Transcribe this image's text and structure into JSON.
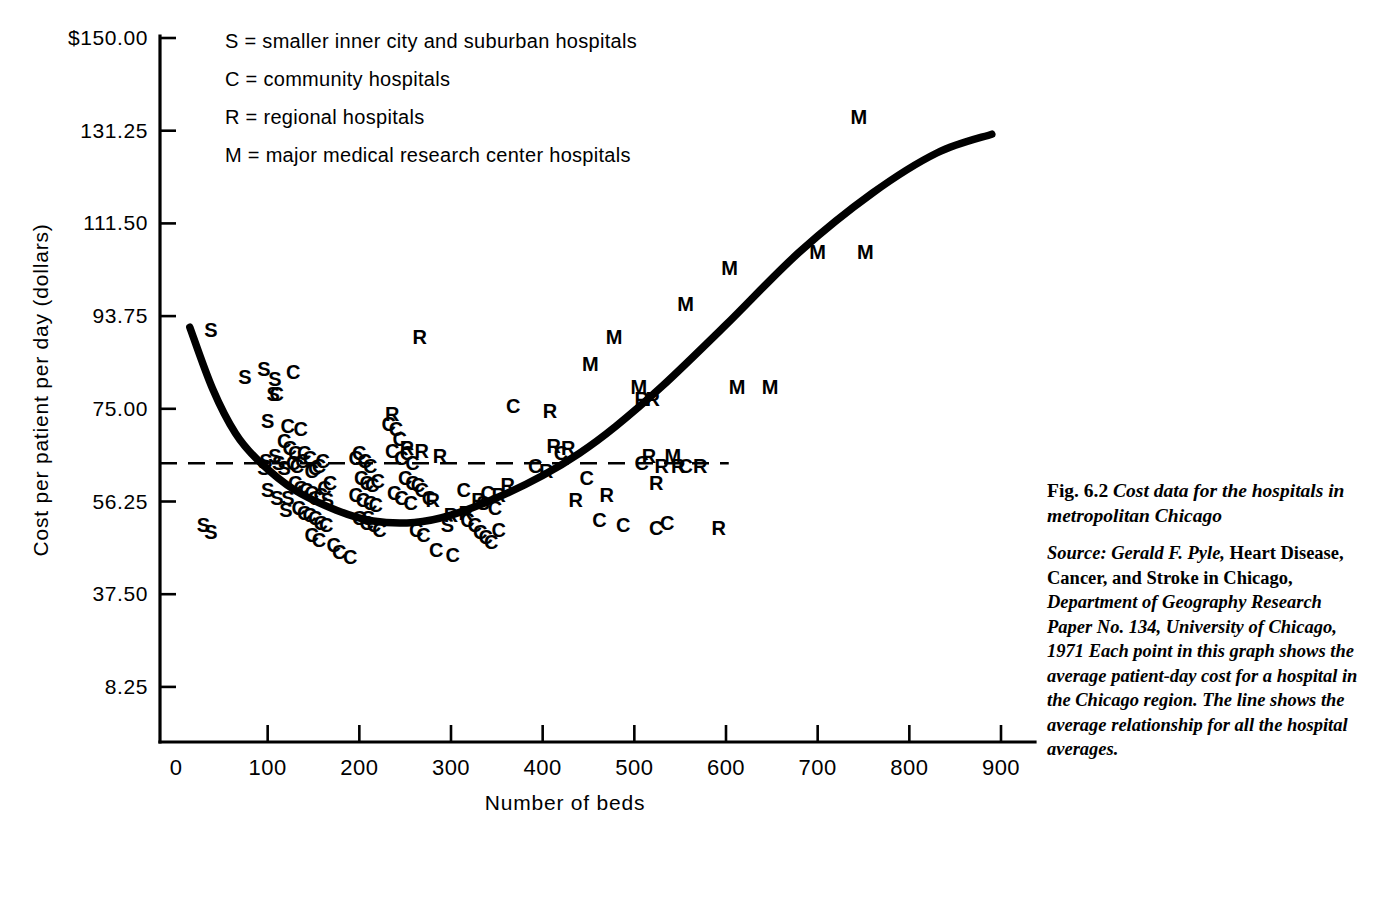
{
  "figure": {
    "caption_number": "Fig. 6.2",
    "caption_title": "Cost data for the hospitals in metropolitan Chicago",
    "source_line1_italic": "Source: Gerald F. Pyle,",
    "source_line1_roman": "Heart Disease, Cancer, and Stroke in Chicago,",
    "source_line2_italic": "Department of Geography Research Paper No. 134, University of Chicago, 1971 Each point in this graph shows the average patient-day cost for a hospital in the Chicago region. The line shows the average relationship for all the hospital averages."
  },
  "legend": {
    "items": [
      {
        "key": "S",
        "text": "S = smaller inner city and suburban hospitals"
      },
      {
        "key": "C",
        "text": "C = community hospitals"
      },
      {
        "key": "R",
        "text": "R = regional hospitals"
      },
      {
        "key": "M",
        "text": "M = major medical research center hospitals"
      }
    ]
  },
  "chart_data": {
    "type": "scatter",
    "title": "Cost data for the hospitals in metropolitan Chicago",
    "xlabel": "Number of beds",
    "ylabel": "Cost per patient per day (dollars)",
    "xlim": [
      0,
      950
    ],
    "ylim": [
      8.25,
      150.0
    ],
    "grid": false,
    "legend_position": "top-left-inside",
    "xticks": [
      0,
      100,
      200,
      300,
      400,
      500,
      600,
      700,
      800,
      900
    ],
    "xtick_labels": [
      "0",
      "100",
      "200",
      "300",
      "400",
      "500",
      "600",
      "700",
      "800",
      "900"
    ],
    "yticks": [
      8.25,
      37.5,
      56.25,
      75.0,
      93.75,
      111.5,
      131.25,
      150.0
    ],
    "ytick_labels": [
      "8.25",
      "37.50",
      "56.25",
      "75.00",
      "93.75",
      "111.50",
      "131.25",
      "$150.00"
    ],
    "series": [
      {
        "name": "S = smaller inner city and suburban hospitals",
        "marker": "S",
        "points": [
          [
            38,
            91.0
          ],
          [
            75,
            81.5
          ],
          [
            96,
            83.0
          ],
          [
            108,
            81.0
          ],
          [
            106,
            78.0
          ],
          [
            100,
            72.5
          ],
          [
            98,
            64.5
          ],
          [
            96,
            63.0
          ],
          [
            108,
            65.5
          ],
          [
            112,
            64.0
          ],
          [
            100,
            58.5
          ],
          [
            118,
            63.0
          ],
          [
            30,
            51.5
          ],
          [
            38,
            50.0
          ],
          [
            120,
            54.5
          ],
          [
            110,
            57.0
          ],
          [
            122,
            57.0
          ],
          [
            165,
            56.5
          ],
          [
            210,
            53.0
          ],
          [
            296,
            51.5
          ],
          [
            335,
            56.0
          ]
        ]
      },
      {
        "name": "C = community hospitals",
        "marker": "C",
        "points": [
          [
            128,
            82.5
          ],
          [
            110,
            78.0
          ],
          [
            122,
            71.5
          ],
          [
            136,
            71.0
          ],
          [
            118,
            68.5
          ],
          [
            124,
            67.0
          ],
          [
            130,
            66.0
          ],
          [
            128,
            64.0
          ],
          [
            132,
            63.5
          ],
          [
            138,
            64.5
          ],
          [
            140,
            66.0
          ],
          [
            146,
            65.0
          ],
          [
            148,
            62.5
          ],
          [
            152,
            63.0
          ],
          [
            156,
            63.5
          ],
          [
            160,
            64.5
          ],
          [
            130,
            60.0
          ],
          [
            136,
            59.0
          ],
          [
            142,
            58.5
          ],
          [
            148,
            58.0
          ],
          [
            152,
            57.0
          ],
          [
            158,
            57.5
          ],
          [
            162,
            59.0
          ],
          [
            168,
            60.0
          ],
          [
            134,
            55.0
          ],
          [
            140,
            54.0
          ],
          [
            146,
            53.5
          ],
          [
            152,
            53.0
          ],
          [
            158,
            52.0
          ],
          [
            164,
            51.5
          ],
          [
            148,
            49.5
          ],
          [
            156,
            48.5
          ],
          [
            172,
            47.5
          ],
          [
            178,
            46.0
          ],
          [
            190,
            45.0
          ],
          [
            196,
            65.0
          ],
          [
            200,
            66.0
          ],
          [
            206,
            64.5
          ],
          [
            212,
            63.5
          ],
          [
            202,
            61.0
          ],
          [
            208,
            60.0
          ],
          [
            214,
            59.5
          ],
          [
            220,
            60.5
          ],
          [
            196,
            57.5
          ],
          [
            204,
            56.5
          ],
          [
            212,
            56.0
          ],
          [
            218,
            55.5
          ],
          [
            200,
            53.0
          ],
          [
            208,
            52.0
          ],
          [
            216,
            51.5
          ],
          [
            222,
            50.5
          ],
          [
            232,
            72.0
          ],
          [
            240,
            71.0
          ],
          [
            244,
            69.0
          ],
          [
            236,
            66.5
          ],
          [
            246,
            65.0
          ],
          [
            252,
            66.0
          ],
          [
            258,
            64.0
          ],
          [
            250,
            61.0
          ],
          [
            258,
            60.0
          ],
          [
            264,
            59.5
          ],
          [
            238,
            58.0
          ],
          [
            246,
            57.0
          ],
          [
            256,
            56.0
          ],
          [
            268,
            58.5
          ],
          [
            276,
            57.0
          ],
          [
            262,
            50.5
          ],
          [
            270,
            49.5
          ],
          [
            284,
            46.5
          ],
          [
            302,
            45.5
          ],
          [
            318,
            52.5
          ],
          [
            326,
            51.5
          ],
          [
            332,
            50.0
          ],
          [
            338,
            49.0
          ],
          [
            344,
            48.0
          ],
          [
            352,
            50.5
          ],
          [
            348,
            55.0
          ],
          [
            340,
            58.0
          ],
          [
            314,
            58.5
          ],
          [
            368,
            75.5
          ],
          [
            392,
            63.5
          ],
          [
            420,
            66.0
          ],
          [
            448,
            61.0
          ],
          [
            462,
            52.5
          ],
          [
            488,
            51.5
          ],
          [
            508,
            64.0
          ],
          [
            524,
            51.0
          ],
          [
            536,
            52.0
          ],
          [
            556,
            63.5
          ]
        ]
      },
      {
        "name": "R = regional hospitals",
        "marker": "R",
        "points": [
          [
            236,
            74.0
          ],
          [
            252,
            67.0
          ],
          [
            268,
            66.5
          ],
          [
            288,
            65.5
          ],
          [
            280,
            56.5
          ],
          [
            300,
            53.5
          ],
          [
            316,
            54.0
          ],
          [
            330,
            56.5
          ],
          [
            352,
            57.5
          ],
          [
            362,
            59.5
          ],
          [
            266,
            89.5
          ],
          [
            408,
            74.5
          ],
          [
            412,
            67.5
          ],
          [
            428,
            67.0
          ],
          [
            404,
            62.5
          ],
          [
            436,
            56.5
          ],
          [
            470,
            57.5
          ],
          [
            508,
            77.0
          ],
          [
            520,
            77.0
          ],
          [
            516,
            65.5
          ],
          [
            530,
            63.5
          ],
          [
            524,
            60.0
          ],
          [
            548,
            63.5
          ],
          [
            572,
            63.5
          ],
          [
            592,
            51.0
          ]
        ]
      },
      {
        "name": "M = major medical research center hospitals",
        "marker": "M",
        "points": [
          [
            478,
            89.5
          ],
          [
            505,
            79.5
          ],
          [
            452,
            84.0
          ],
          [
            542,
            65.5
          ],
          [
            556,
            96.0
          ],
          [
            604,
            103.0
          ],
          [
            612,
            79.5
          ],
          [
            648,
            79.5
          ],
          [
            700,
            106.0
          ],
          [
            745,
            134.0
          ],
          [
            752,
            106.0
          ]
        ]
      }
    ],
    "trend_line": {
      "description": "The line shows the average relationship for all the hospital averages.",
      "points": [
        [
          15,
          91.5
        ],
        [
          40,
          79.0
        ],
        [
          65,
          70.0
        ],
        [
          90,
          64.5
        ],
        [
          130,
          58.5
        ],
        [
          175,
          54.5
        ],
        [
          215,
          52.3
        ],
        [
          260,
          52.0
        ],
        [
          300,
          53.5
        ],
        [
          350,
          57.0
        ],
        [
          400,
          61.5
        ],
        [
          440,
          66.0
        ],
        [
          480,
          71.5
        ],
        [
          530,
          79.5
        ],
        [
          600,
          92.0
        ],
        [
          680,
          106.0
        ],
        [
          760,
          118.0
        ],
        [
          830,
          126.5
        ],
        [
          890,
          130.5
        ]
      ]
    },
    "reference_line": {
      "style": "dashed",
      "y_value": 64.0,
      "x_from": 0,
      "x_to": 603,
      "note": "horizontal dashed reference line across mid plot"
    }
  }
}
